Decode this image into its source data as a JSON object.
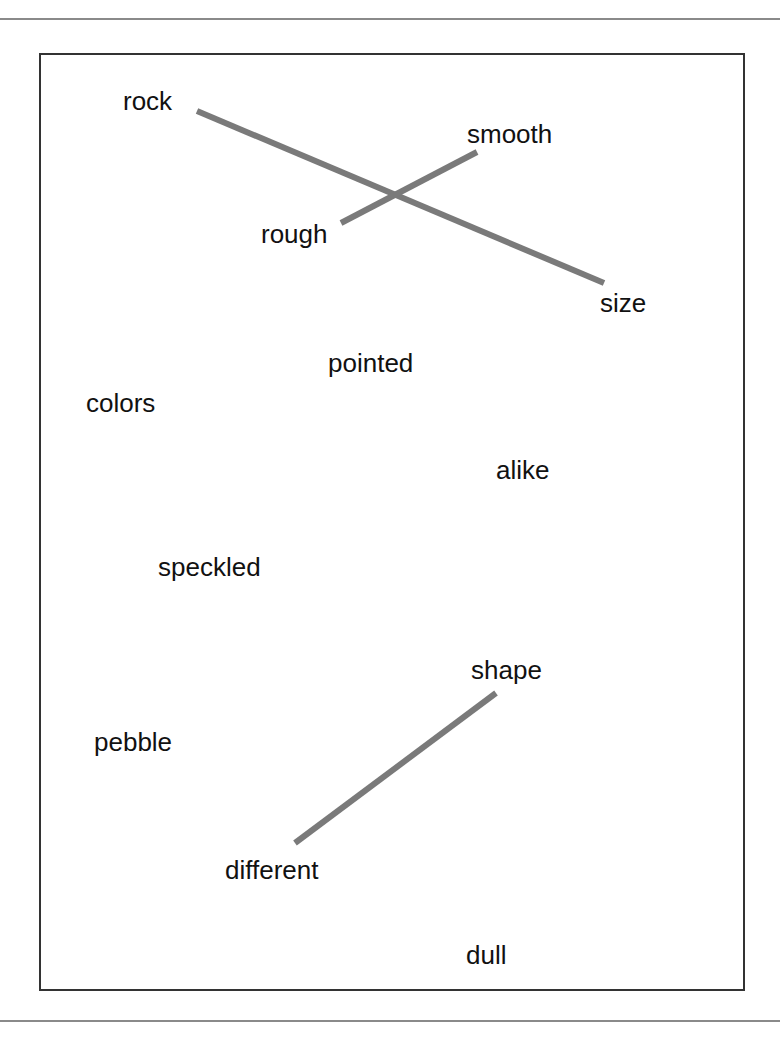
{
  "worksheet": {
    "type": "word-matching exercise",
    "words": [
      {
        "id": "rock",
        "text": "rock",
        "x": 123,
        "y": 88
      },
      {
        "id": "smooth",
        "text": "smooth",
        "x": 467,
        "y": 121
      },
      {
        "id": "rough",
        "text": "rough",
        "x": 261,
        "y": 221
      },
      {
        "id": "size",
        "text": "size",
        "x": 600,
        "y": 290
      },
      {
        "id": "pointed",
        "text": "pointed",
        "x": 328,
        "y": 350
      },
      {
        "id": "colors",
        "text": "colors",
        "x": 86,
        "y": 390
      },
      {
        "id": "alike",
        "text": "alike",
        "x": 496,
        "y": 457
      },
      {
        "id": "speckled",
        "text": "speckled",
        "x": 158,
        "y": 554
      },
      {
        "id": "shape",
        "text": "shape",
        "x": 471,
        "y": 657
      },
      {
        "id": "pebble",
        "text": "pebble",
        "x": 94,
        "y": 729
      },
      {
        "id": "different",
        "text": "different",
        "x": 225,
        "y": 857
      },
      {
        "id": "dull",
        "text": "dull",
        "x": 466,
        "y": 942
      }
    ],
    "connections": [
      {
        "from": "rock",
        "to": "size",
        "x1": 197,
        "y1": 111,
        "x2": 604,
        "y2": 283
      },
      {
        "from": "rough",
        "to": "smooth",
        "x1": 341,
        "y1": 223,
        "x2": 477,
        "y2": 152
      },
      {
        "from": "different",
        "to": "shape",
        "x1": 295,
        "y1": 843,
        "x2": 496,
        "y2": 693
      }
    ],
    "line_color": "#7a7a7a",
    "line_width": 6
  }
}
